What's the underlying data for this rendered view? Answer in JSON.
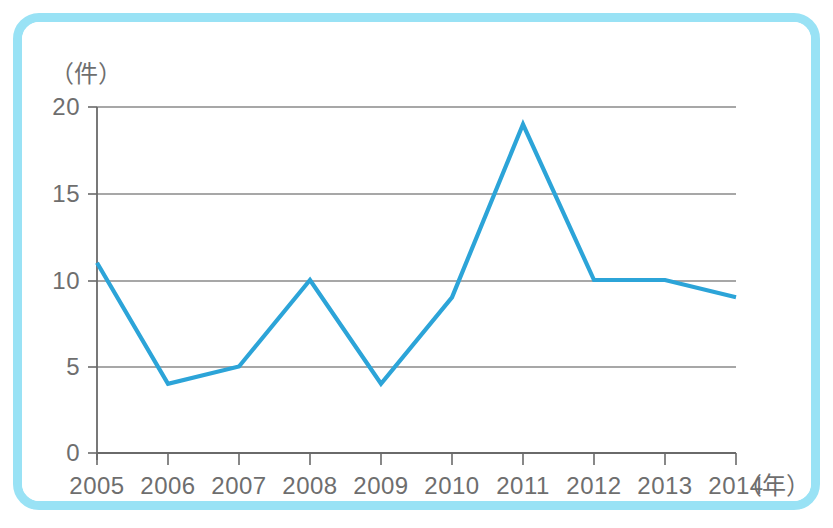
{
  "figure": {
    "frame_color": "#99e2f5",
    "background": "#ffffff"
  },
  "axis": {
    "y_unit_label": "（件）",
    "x_unit_label": "（年）",
    "y_ticks": [
      "0",
      "5",
      "10",
      "15",
      "20"
    ],
    "x_ticks": [
      "2005",
      "2006",
      "2007",
      "2008",
      "2009",
      "2010",
      "2011",
      "2012",
      "2013",
      "2014"
    ]
  },
  "chart_data": {
    "type": "line",
    "title": "",
    "xlabel": "（年）",
    "ylabel": "（件）",
    "categories": [
      "2005",
      "2006",
      "2007",
      "2008",
      "2009",
      "2010",
      "2011",
      "2012",
      "2013",
      "2014"
    ],
    "x": [
      2005,
      2006,
      2007,
      2008,
      2009,
      2010,
      2011,
      2012,
      2013,
      2014
    ],
    "values": [
      11,
      4,
      5,
      10,
      4,
      9,
      19,
      10,
      10,
      9
    ],
    "series": [
      {
        "name": "件数",
        "color": "#2ca4d8",
        "values": [
          11,
          4,
          5,
          10,
          4,
          9,
          19,
          10,
          10,
          9
        ]
      }
    ],
    "ylim": [
      0,
      20
    ],
    "ytick_values": [
      0,
      5,
      10,
      15,
      20
    ],
    "grid": true,
    "grid_axis": "y",
    "legend": false,
    "legend_position": "none",
    "markers": false,
    "annotations": []
  }
}
